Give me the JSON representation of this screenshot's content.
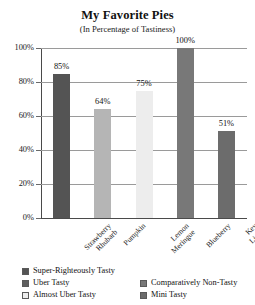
{
  "chart_data": {
    "type": "bar",
    "title": "My Favorite Pies",
    "subtitle": "(In Percentage of Tastiness)",
    "xlabel": "",
    "ylabel": "",
    "categories": [
      "Strawberry Rhubarb",
      "Pumpkin",
      "Lemon Meringue",
      "Blueberry",
      "Key Lime"
    ],
    "values": [
      85,
      64,
      75,
      100,
      51
    ],
    "data_labels": [
      "85%",
      "64%",
      "75%",
      "100%",
      "51%"
    ],
    "bar_colors": [
      "#545454",
      "#b5b5b5",
      "#ededed",
      "#787878",
      "#6c6c6c"
    ],
    "ylim": [
      0,
      100
    ],
    "yticks": [
      0,
      20,
      40,
      60,
      80,
      100
    ],
    "ytick_labels": [
      "0%",
      "20%",
      "40%",
      "60%",
      "80%",
      "100%"
    ],
    "grid": true,
    "legend_position": "bottom",
    "legend": [
      {
        "label": "Super-Righteously Tasty",
        "color": "#545454"
      },
      {
        "label": "Uber Tasty",
        "color": "#5e5e5e"
      },
      {
        "label": "Almost Uber Tasty",
        "color": "#ededed"
      },
      {
        "label": "Comparatively Non-Tasty",
        "color": "#787878"
      },
      {
        "label": "Mini Tasty",
        "color": "#6c6c6c"
      }
    ]
  }
}
